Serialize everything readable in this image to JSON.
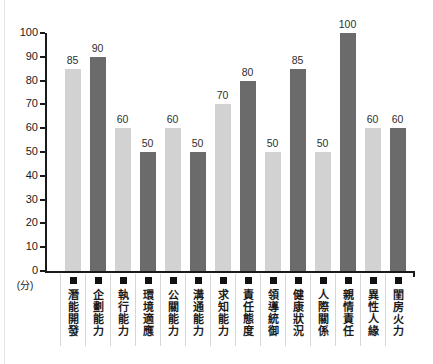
{
  "chart_data": {
    "type": "bar",
    "title": "",
    "unit_label": "(分)",
    "categories": [
      "潛能開發",
      "企劃能力",
      "執行能力",
      "環境適應",
      "公關能力",
      "溝通能力",
      "求知能力",
      "責任態度",
      "領導統御",
      "健康狀況",
      "人際關係",
      "親情責任",
      "異性人緣",
      "閨房火力"
    ],
    "values": [
      85,
      90,
      60,
      50,
      60,
      50,
      70,
      80,
      50,
      85,
      50,
      100,
      60,
      60
    ],
    "value_labels_shown": true,
    "category_marker": "■",
    "xlabel": "",
    "ylabel": "",
    "ylim": [
      0,
      100
    ],
    "yticks": [
      0,
      10,
      20,
      30,
      40,
      50,
      60,
      70,
      80,
      90,
      100
    ],
    "grid": false,
    "legend_position": "none",
    "bar_color_pattern": "alternating"
  },
  "colors": {
    "background": "#ffffff",
    "bar_light": "#d2d2d2",
    "bar_dark": "#6b6b6b",
    "axis": "#1a1a1a",
    "value_text": "#2e2e2e",
    "category_text": "#1c1c1c",
    "separator": "#d6d6d6",
    "marker": "#111111"
  }
}
